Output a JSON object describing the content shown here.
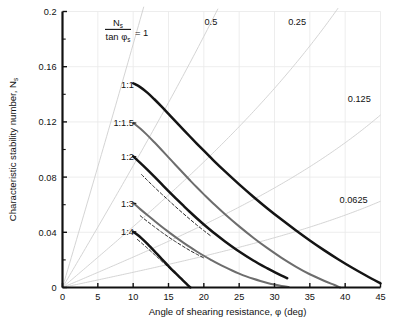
{
  "chart_data": {
    "type": "line",
    "title": "",
    "xlabel": "Angle of shearing resistance, φ (deg)",
    "ylabel": "Characteristic stability number, N",
    "ylabel_sub": "s",
    "xlim": [
      0,
      45
    ],
    "ylim": [
      0,
      0.2
    ],
    "grid": true,
    "legend_position": "inline-labels",
    "x_ticks": [
      0,
      5,
      10,
      15,
      20,
      25,
      30,
      35,
      40,
      45
    ],
    "x_tick_labels": [
      "0",
      "5",
      "10",
      "15",
      "20",
      "25",
      "30",
      "35",
      "40",
      "45"
    ],
    "y_ticks": [
      0,
      0.04,
      0.08,
      0.12,
      0.16,
      0.2
    ],
    "y_tick_labels": [
      "0",
      "0.04",
      "0.08",
      "0.12",
      "0.16",
      "0.2"
    ],
    "y_minor_ticks": [
      0.02,
      0.06,
      0.1,
      0.14,
      0.18
    ],
    "formula_annotation": {
      "numerator": "N",
      "numerator_sub": "s",
      "denominator": "tan φ",
      "denominator_sub": "s",
      "equals": "= 1"
    },
    "ray_lines": [
      {
        "label": "1",
        "ratio": 1.0,
        "label_x": 12.8,
        "label_y": 0.196,
        "is_formula_label": true
      },
      {
        "label": "0.5",
        "ratio": 0.5,
        "label_x": 21.0,
        "label_y": 0.1905
      },
      {
        "label": "0.25",
        "ratio": 0.25,
        "label_x": 33.2,
        "label_y": 0.1905
      },
      {
        "label": "0.125",
        "ratio": 0.125,
        "label_x": 42.0,
        "label_y": 0.1345
      },
      {
        "label": "0.0625",
        "ratio": 0.0625,
        "label_x": 41.2,
        "label_y": 0.0615
      }
    ],
    "series": [
      {
        "name": "1:1",
        "label": "1:1",
        "style": "solid",
        "weight": "heavy",
        "color": "#141414",
        "label_x": 10.8,
        "label_y": 0.1468,
        "points": [
          [
            10.0,
            0.148
          ],
          [
            11.0,
            0.1452
          ],
          [
            12.0,
            0.1412
          ],
          [
            13.0,
            0.1364
          ],
          [
            14.0,
            0.1312
          ],
          [
            15.0,
            0.1258
          ],
          [
            16.0,
            0.1204
          ],
          [
            17.0,
            0.115
          ],
          [
            18.0,
            0.1096
          ],
          [
            19.0,
            0.1043
          ],
          [
            20.0,
            0.0991
          ],
          [
            21.5,
            0.0914
          ],
          [
            23.0,
            0.0841
          ],
          [
            25.0,
            0.0747
          ],
          [
            27.0,
            0.0658
          ],
          [
            29.0,
            0.0573
          ],
          [
            31.0,
            0.0492
          ],
          [
            33.0,
            0.0415
          ],
          [
            35.0,
            0.0341
          ],
          [
            37.0,
            0.0271
          ],
          [
            39.0,
            0.0205
          ],
          [
            41.0,
            0.0143
          ],
          [
            43.0,
            0.0085
          ],
          [
            45.0,
            0.003
          ]
        ]
      },
      {
        "name": "1:1.5",
        "label": "1:1.5",
        "style": "solid",
        "weight": "medium",
        "color": "#6d6d6d",
        "label_x": 10.8,
        "label_y": 0.1192,
        "points": [
          [
            10.0,
            0.1193
          ],
          [
            11.0,
            0.1152
          ],
          [
            12.0,
            0.1104
          ],
          [
            13.0,
            0.1052
          ],
          [
            14.0,
            0.0998
          ],
          [
            15.0,
            0.0943
          ],
          [
            16.0,
            0.0888
          ],
          [
            17.0,
            0.0833
          ],
          [
            18.0,
            0.0779
          ],
          [
            19.0,
            0.0726
          ],
          [
            20.0,
            0.0675
          ],
          [
            21.5,
            0.0601
          ],
          [
            23.0,
            0.0531
          ],
          [
            25.0,
            0.0443
          ],
          [
            27.0,
            0.0361
          ],
          [
            29.0,
            0.0285
          ],
          [
            31.0,
            0.0215
          ],
          [
            33.0,
            0.0152
          ],
          [
            35.0,
            0.0096
          ],
          [
            37.0,
            0.0049
          ],
          [
            38.5,
            0.0018
          ],
          [
            39.3,
            0.0
          ]
        ]
      },
      {
        "name": "1:2",
        "label": "1:2",
        "style": "solid",
        "weight": "heavy",
        "color": "#141414",
        "label_x": 10.8,
        "label_y": 0.0948,
        "points": [
          [
            10.0,
            0.095
          ],
          [
            11.0,
            0.0903
          ],
          [
            12.0,
            0.0854
          ],
          [
            13.0,
            0.0803
          ],
          [
            14.0,
            0.0751
          ],
          [
            15.0,
            0.0699
          ],
          [
            16.0,
            0.0648
          ],
          [
            17.0,
            0.0598
          ],
          [
            18.0,
            0.0549
          ],
          [
            19.0,
            0.0502
          ],
          [
            20.0,
            0.0457
          ],
          [
            21.5,
            0.0393
          ],
          [
            23.0,
            0.0334
          ],
          [
            25.0,
            0.0261
          ],
          [
            27.0,
            0.0196
          ],
          [
            29.0,
            0.0138
          ],
          [
            30.0,
            0.0111
          ],
          [
            31.0,
            0.0086
          ],
          [
            31.8,
            0.0067
          ]
        ]
      },
      {
        "name": "1:3",
        "label": "1:3",
        "style": "solid",
        "weight": "medium",
        "color": "#6d6d6d",
        "label_x": 10.8,
        "label_y": 0.0608,
        "points": [
          [
            10.0,
            0.0612
          ],
          [
            11.0,
            0.0568
          ],
          [
            12.0,
            0.0525
          ],
          [
            13.0,
            0.0483
          ],
          [
            14.0,
            0.0442
          ],
          [
            15.0,
            0.0403
          ],
          [
            16.0,
            0.0365
          ],
          [
            17.0,
            0.0329
          ],
          [
            18.0,
            0.0294
          ],
          [
            19.0,
            0.0261
          ],
          [
            20.0,
            0.023
          ],
          [
            21.0,
            0.0201
          ],
          [
            22.0,
            0.0173
          ],
          [
            23.0,
            0.0147
          ],
          [
            24.0,
            0.0123
          ],
          [
            25.0,
            0.0101
          ],
          [
            26.0,
            0.0081
          ],
          [
            27.0,
            0.0063
          ],
          [
            28.0,
            0.0047
          ],
          [
            29.0,
            0.0033
          ],
          [
            30.0,
            0.0021
          ],
          [
            31.0,
            0.0011
          ],
          [
            32.0,
            0.0003
          ]
        ]
      },
      {
        "name": "1:4",
        "label": "1:4",
        "style": "solid",
        "weight": "heavy",
        "color": "#141414",
        "label_x": 10.8,
        "label_y": 0.0404,
        "points": [
          [
            10.0,
            0.0404
          ],
          [
            10.6,
            0.0382
          ],
          [
            11.2,
            0.0356
          ],
          [
            11.8,
            0.0327
          ],
          [
            12.4,
            0.0296
          ],
          [
            13.0,
            0.0264
          ],
          [
            13.6,
            0.0231
          ],
          [
            14.2,
            0.0198
          ],
          [
            14.8,
            0.0166
          ],
          [
            15.4,
            0.0134
          ],
          [
            16.0,
            0.0104
          ],
          [
            16.6,
            0.0074
          ],
          [
            17.0,
            0.0054
          ],
          [
            17.4,
            0.0034
          ],
          [
            17.8,
            0.0014
          ],
          [
            18.1,
            0.0
          ]
        ]
      }
    ],
    "dashed_series": [
      {
        "name": "1:2-dashed",
        "style": "dashed",
        "color": "#2a2a2a",
        "points": [
          [
            11.2,
            0.0818
          ],
          [
            12.0,
            0.0777
          ],
          [
            13.0,
            0.0727
          ],
          [
            14.0,
            0.0679
          ],
          [
            15.0,
            0.0632
          ],
          [
            16.0,
            0.0585
          ],
          [
            17.0,
            0.054
          ],
          [
            18.0,
            0.0496
          ],
          [
            19.0,
            0.0453
          ],
          [
            20.0,
            0.0412
          ],
          [
            21.0,
            0.0373
          ]
        ]
      },
      {
        "name": "1:3-dashed",
        "style": "dashed",
        "color": "#2a2a2a",
        "points": [
          [
            11.0,
            0.052
          ],
          [
            12.0,
            0.0479
          ],
          [
            13.0,
            0.044
          ],
          [
            14.0,
            0.0402
          ],
          [
            15.0,
            0.0366
          ],
          [
            16.0,
            0.0332
          ],
          [
            17.0,
            0.03
          ],
          [
            18.0,
            0.0269
          ],
          [
            19.0,
            0.0241
          ],
          [
            20.0,
            0.0214
          ]
        ]
      },
      {
        "name": "1:4-dashed",
        "style": "dashed",
        "color": "#2a2a2a",
        "points": [
          [
            10.6,
            0.0348
          ],
          [
            11.2,
            0.0322
          ],
          [
            11.8,
            0.0295
          ],
          [
            12.4,
            0.0267
          ],
          [
            13.0,
            0.0239
          ],
          [
            13.6,
            0.0211
          ],
          [
            14.2,
            0.0183
          ],
          [
            14.8,
            0.0155
          ],
          [
            15.4,
            0.0128
          ],
          [
            16.0,
            0.0102
          ]
        ]
      }
    ]
  }
}
